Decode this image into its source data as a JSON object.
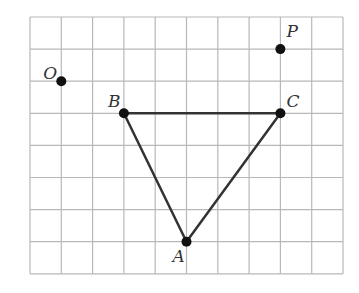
{
  "grid": {
    "origin_x": 30,
    "origin_y": 17,
    "cell_w": 31.3,
    "cell_h": 32.1,
    "cols": 10,
    "rows": 8,
    "line_color": "#b8b8b8"
  },
  "points": [
    {
      "name": "O",
      "col": 1,
      "row": 2,
      "label_dx": -18,
      "label_dy": -2
    },
    {
      "name": "P",
      "col": 8,
      "row": 1,
      "label_dx": 6,
      "label_dy": -12
    },
    {
      "name": "B",
      "col": 3,
      "row": 3,
      "label_dx": -16,
      "label_dy": -6
    },
    {
      "name": "C",
      "col": 8,
      "row": 3,
      "label_dx": 6,
      "label_dy": -6
    },
    {
      "name": "A",
      "col": 5,
      "row": 7,
      "label_dx": -14,
      "label_dy": 20
    }
  ],
  "triangle": {
    "vertices": [
      "A",
      "B",
      "C"
    ],
    "stroke": "#333333"
  },
  "labels": {
    "O": "O",
    "P": "P",
    "B": "B",
    "C": "C",
    "A": "A"
  }
}
